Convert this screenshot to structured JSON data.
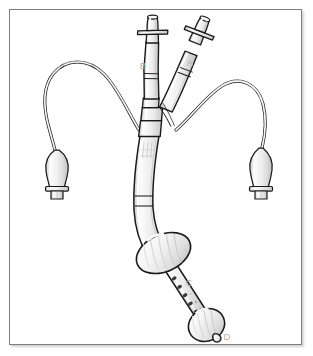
{
  "figure": {
    "background_color": "#ffffff",
    "frame_border_color": "#7e7e7e",
    "line_color": "#1a1a1a",
    "fill_color": "#f2f2f2",
    "shade_color": "#d8d8d8",
    "label_color": "#b3b3b3",
    "hole_color": "#3a3a3a"
  },
  "callouts": [
    {
      "id": "label-a",
      "text": "A",
      "x": 189,
      "y": 66,
      "describes": "gastric-balloon-inflation-port"
    },
    {
      "id": "label-b",
      "text": "B",
      "x": 147,
      "y": 65,
      "describes": "esophageal-balloon-inflation-port"
    },
    {
      "id": "label-c",
      "text": "C",
      "x": 188,
      "y": 284,
      "describes": "perforated-aspiration-section"
    },
    {
      "id": "label-d",
      "text": "D",
      "x": 225,
      "y": 336,
      "describes": "distal-gastric-balloon"
    }
  ],
  "parts": {
    "connector_a": "luer-connector-a",
    "connector_b": "luer-connector-b",
    "pilot_balloon_left": "pilot-balloon-left",
    "pilot_balloon_right": "pilot-balloon-right",
    "pilot_tube_left": "pilot-tube-left",
    "pilot_tube_right": "pilot-tube-right",
    "main_shaft": "main-catheter-shaft",
    "proximal_cuff": "esophageal-balloon-cuff",
    "perforated_segment": "perforated-drainage-segment",
    "distal_balloon": "gastric-balloon",
    "distal_tip": "distal-tip"
  }
}
